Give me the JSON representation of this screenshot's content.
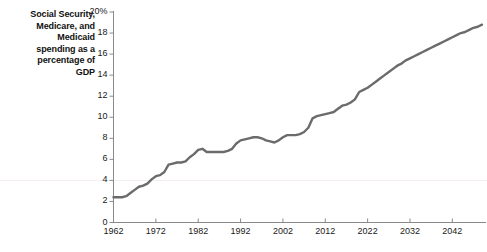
{
  "chart_data": {
    "type": "line",
    "title": "Social Security, Medicare, and Medicaid spending as a percentage of GDP",
    "title_lines": [
      "Social Security,",
      "Medicare, and",
      "Medicaid",
      "spending as a",
      "percentage of",
      "GDP"
    ],
    "xlabel": "",
    "ylabel": "",
    "xlim": [
      1962,
      2049
    ],
    "ylim": [
      0,
      20
    ],
    "grid": false,
    "legend": null,
    "line_color": "#6b6b6b",
    "axis_color": "#8a8a8a",
    "text_color": "#1a1a1a",
    "ytick_labels": [
      "0",
      "2",
      "4",
      "6",
      "8",
      "10",
      "12",
      "14",
      "16",
      "18",
      "20%"
    ],
    "ytick_values": [
      0,
      2,
      4,
      6,
      8,
      10,
      12,
      14,
      16,
      18,
      20
    ],
    "xtick_labels": [
      "1962",
      "1972",
      "1982",
      "1992",
      "2002",
      "2012",
      "2022",
      "2032",
      "2042"
    ],
    "xtick_values": [
      1962,
      1972,
      1982,
      1992,
      2002,
      2012,
      2022,
      2032,
      2042
    ],
    "x": [
      1962,
      1963,
      1964,
      1965,
      1966,
      1967,
      1968,
      1969,
      1970,
      1971,
      1972,
      1973,
      1974,
      1975,
      1976,
      1977,
      1978,
      1979,
      1980,
      1981,
      1982,
      1983,
      1984,
      1985,
      1986,
      1987,
      1988,
      1989,
      1990,
      1991,
      1992,
      1993,
      1994,
      1995,
      1996,
      1997,
      1998,
      1999,
      2000,
      2001,
      2002,
      2003,
      2004,
      2005,
      2006,
      2007,
      2008,
      2009,
      2010,
      2011,
      2012,
      2013,
      2014,
      2015,
      2016,
      2017,
      2018,
      2019,
      2020,
      2021,
      2022,
      2023,
      2024,
      2025,
      2026,
      2027,
      2028,
      2029,
      2030,
      2031,
      2032,
      2033,
      2034,
      2035,
      2036,
      2037,
      2038,
      2039,
      2040,
      2041,
      2042,
      2043,
      2044,
      2045,
      2046,
      2047,
      2048,
      2049
    ],
    "values": [
      2.4,
      2.4,
      2.4,
      2.5,
      2.8,
      3.1,
      3.4,
      3.5,
      3.7,
      4.1,
      4.4,
      4.5,
      4.8,
      5.5,
      5.6,
      5.7,
      5.7,
      5.8,
      6.2,
      6.5,
      6.9,
      7.0,
      6.7,
      6.7,
      6.7,
      6.7,
      6.7,
      6.8,
      7.0,
      7.5,
      7.8,
      7.9,
      8.0,
      8.1,
      8.1,
      8.0,
      7.8,
      7.7,
      7.6,
      7.8,
      8.1,
      8.3,
      8.3,
      8.3,
      8.4,
      8.6,
      9.0,
      9.9,
      10.1,
      10.2,
      10.3,
      10.4,
      10.5,
      10.8,
      11.1,
      11.2,
      11.4,
      11.7,
      12.4,
      12.6,
      12.8,
      13.1,
      13.4,
      13.7,
      14.0,
      14.3,
      14.6,
      14.9,
      15.1,
      15.4,
      15.6,
      15.8,
      16.0,
      16.2,
      16.4,
      16.6,
      16.8,
      17.0,
      17.2,
      17.4,
      17.6,
      17.8,
      18.0,
      18.1,
      18.3,
      18.5,
      18.6,
      18.8
    ]
  },
  "axes": {
    "y_axis_name": "y-axis",
    "x_axis_name": "x-axis"
  }
}
